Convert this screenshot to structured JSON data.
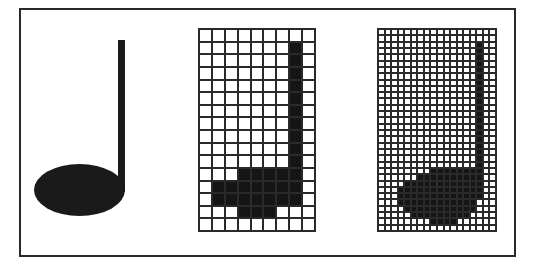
{
  "figure": {
    "panels": [
      {
        "id": "original",
        "label": ""
      },
      {
        "id": "coarse-grid",
        "label": "",
        "cols": 9,
        "rows": 16
      },
      {
        "id": "fine-grid",
        "label": "",
        "cols": 18,
        "rows": 32
      }
    ]
  },
  "colors": {
    "ink": "#151515",
    "grid_line": "#2a2a2a",
    "background": "#ffffff"
  },
  "coarse_filled": [
    [
      1,
      7
    ],
    [
      2,
      7
    ],
    [
      3,
      7
    ],
    [
      4,
      7
    ],
    [
      5,
      7
    ],
    [
      6,
      7
    ],
    [
      7,
      7
    ],
    [
      8,
      7
    ],
    [
      9,
      7
    ],
    [
      10,
      7
    ],
    [
      11,
      3
    ],
    [
      11,
      4
    ],
    [
      11,
      5
    ],
    [
      11,
      6
    ],
    [
      11,
      7
    ],
    [
      12,
      1
    ],
    [
      12,
      2
    ],
    [
      12,
      3
    ],
    [
      12,
      4
    ],
    [
      12,
      5
    ],
    [
      12,
      6
    ],
    [
      12,
      7
    ],
    [
      13,
      1
    ],
    [
      13,
      2
    ],
    [
      13,
      3
    ],
    [
      13,
      4
    ],
    [
      13,
      5
    ],
    [
      13,
      6
    ],
    [
      13,
      7
    ],
    [
      14,
      3
    ],
    [
      14,
      4
    ],
    [
      14,
      5
    ]
  ],
  "fine_filled_rows": {
    "2": [
      15
    ],
    "3": [
      15
    ],
    "4": [
      15
    ],
    "5": [
      15
    ],
    "6": [
      15
    ],
    "7": [
      15
    ],
    "8": [
      15
    ],
    "9": [
      15
    ],
    "10": [
      15
    ],
    "11": [
      15
    ],
    "12": [
      15
    ],
    "13": [
      15
    ],
    "14": [
      15
    ],
    "15": [
      15
    ],
    "16": [
      15
    ],
    "17": [
      15
    ],
    "18": [
      15
    ],
    "19": [
      15
    ],
    "20": [
      15
    ],
    "21": [
      15
    ],
    "22": [
      8,
      9,
      10,
      11,
      12,
      13,
      14,
      15
    ],
    "23": [
      6,
      7,
      8,
      9,
      10,
      11,
      12,
      13,
      14,
      15
    ],
    "24": [
      4,
      5,
      6,
      7,
      8,
      9,
      10,
      11,
      12,
      13,
      14,
      15
    ],
    "25": [
      3,
      4,
      5,
      6,
      7,
      8,
      9,
      10,
      11,
      12,
      13,
      14,
      15
    ],
    "26": [
      3,
      4,
      5,
      6,
      7,
      8,
      9,
      10,
      11,
      12,
      13,
      14,
      15
    ],
    "27": [
      3,
      4,
      5,
      6,
      7,
      8,
      9,
      10,
      11,
      12,
      13,
      14
    ],
    "28": [
      4,
      5,
      6,
      7,
      8,
      9,
      10,
      11,
      12,
      13,
      14
    ],
    "29": [
      5,
      6,
      7,
      8,
      9,
      10,
      11,
      12,
      13
    ],
    "30": [
      8,
      9,
      10,
      11
    ]
  }
}
